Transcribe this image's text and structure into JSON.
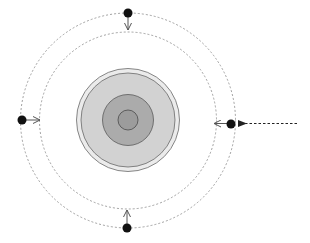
{
  "diagram": {
    "title": "",
    "background": "#ffffff",
    "center": [
      128,
      120
    ],
    "orbits": [
      {
        "name": "outer-orbit",
        "radius": 107,
        "stroke": "#8a8a8a",
        "dash": "2,2"
      },
      {
        "name": "inner-orbit",
        "radius": 88,
        "stroke": "#8a8a8a",
        "dash": "2,2"
      }
    ],
    "body": {
      "rings": [
        {
          "name": "outer-shell",
          "radius": 52,
          "fill": "#e6e6e6",
          "stroke": "#6a6a6a"
        },
        {
          "name": "mantle",
          "radius": 47,
          "fill": "#d0d0d0",
          "stroke": "#6a6a6a"
        },
        {
          "name": "outer-core",
          "radius": 26,
          "fill": "#a9a9a9",
          "stroke": "#5a5a5a"
        },
        {
          "name": "inner-core",
          "radius": 10,
          "fill": "#9a9a9a",
          "stroke": "#4a4a4a"
        }
      ]
    },
    "satellites": [
      {
        "name": "satellite-top",
        "cx": 128,
        "cy": 13,
        "r": 4.5,
        "arrow_to": [
          128,
          31
        ]
      },
      {
        "name": "satellite-left",
        "cx": 22,
        "cy": 120,
        "r": 4.5,
        "arrow_to": [
          41,
          120
        ]
      },
      {
        "name": "satellite-right",
        "cx": 231,
        "cy": 124,
        "r": 4.5,
        "arrow_to": [
          214,
          123
        ]
      },
      {
        "name": "satellite-bottom",
        "cx": 127,
        "cy": 228,
        "r": 4.5,
        "arrow_to": [
          127,
          209
        ]
      }
    ],
    "incoming_arrow": {
      "x1": 298,
      "y1": 123,
      "x2": 245,
      "y2": 123,
      "stroke": "#222222"
    },
    "dot_color": "#111111",
    "arrow_color": "#555555"
  }
}
